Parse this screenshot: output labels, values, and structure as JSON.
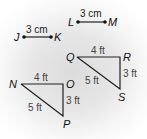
{
  "segments": [
    {
      "name": "LM",
      "start_label": "L",
      "end_label": "M",
      "length_label": "3 cm"
    },
    {
      "name": "JK",
      "start_label": "J",
      "end_label": "K",
      "length_label": "3 cm"
    }
  ],
  "triangles": [
    {
      "name": "QRS",
      "vertices": [
        "Q",
        "R",
        "S"
      ],
      "sides": {
        "QR": "4 ft",
        "RS": "3 ft",
        "QS": "5 ft"
      }
    },
    {
      "name": "NOP",
      "vertices": [
        "N",
        "O",
        "P"
      ],
      "sides": {
        "NO": "4 ft",
        "OP": "3 ft",
        "NP": "5 ft"
      }
    }
  ]
}
